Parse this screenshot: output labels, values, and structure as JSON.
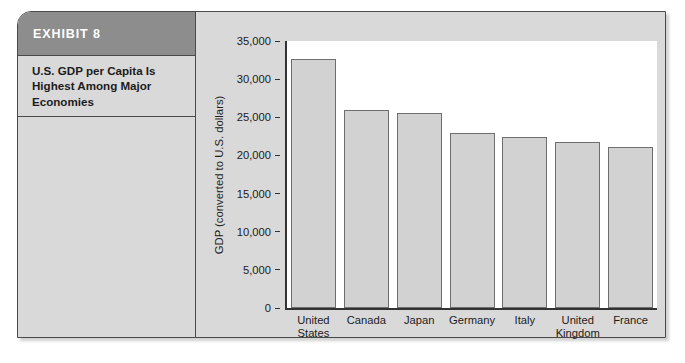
{
  "exhibit": {
    "label": "EXHIBIT 8",
    "caption": "U.S. GDP per Capita Is Highest Among Major Economies",
    "header_color": "#8d8d8d",
    "panel_color": "#d9d9d9",
    "border_color": "#4a4a4a"
  },
  "chart_data": {
    "type": "bar",
    "title": "U.S. GDP per Capita Is Highest Among Major Economies",
    "xlabel": "",
    "ylabel": "GDP (converted to U.S. dollars)",
    "categories": [
      "United States",
      "Canada",
      "Japan",
      "Germany",
      "Italy",
      "United Kingdom",
      "France"
    ],
    "category_lines": [
      [
        "United",
        "States"
      ],
      [
        "Canada"
      ],
      [
        "Japan"
      ],
      [
        "Germany"
      ],
      [
        "Italy"
      ],
      [
        "United",
        "Kingdom"
      ],
      [
        "France"
      ]
    ],
    "values": [
      32700,
      26000,
      25500,
      23000,
      22400,
      21700,
      21100
    ],
    "ylim": [
      0,
      35000
    ],
    "yticks": [
      0,
      5000,
      10000,
      15000,
      20000,
      25000,
      30000,
      35000
    ],
    "ytick_labels": [
      "0",
      "5,000",
      "10,000",
      "15,000",
      "20,000",
      "25,000",
      "30,000",
      "35,000"
    ],
    "grid": false,
    "legend": false,
    "bar_fill": "#d2d2d2",
    "bar_edge": "#6e6e6e",
    "plot_background": "#ffffff"
  }
}
